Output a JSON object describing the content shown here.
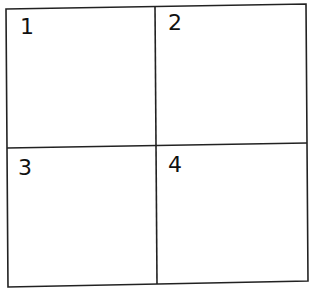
{
  "diagram": {
    "type": "2x2 grid",
    "line_color": "#222222",
    "cells": [
      {
        "label": "1"
      },
      {
        "label": "2"
      },
      {
        "label": "3"
      },
      {
        "label": "4"
      }
    ]
  }
}
